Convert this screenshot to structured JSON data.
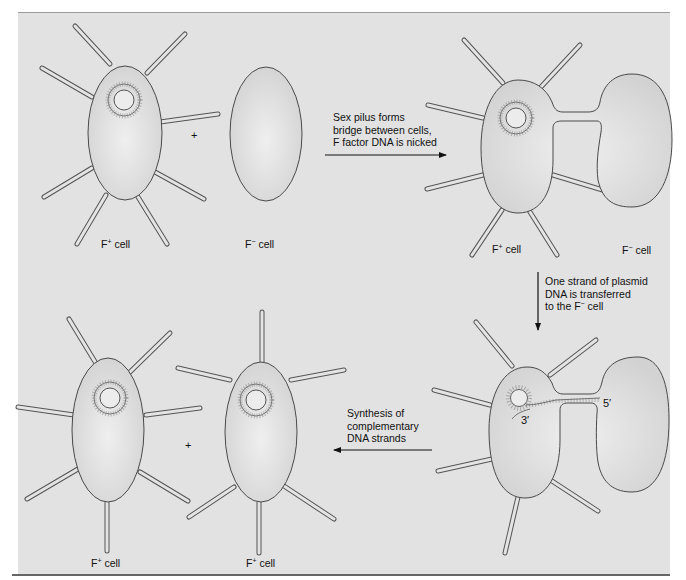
{
  "diagram": {
    "type": "bacterial-conjugation",
    "colors": {
      "panel_bg": "#e2e2e2",
      "cell_fill_center": "#ececec",
      "cell_fill_edge": "#d4d4d4",
      "outline": "#4a4a4a",
      "text": "#111111"
    },
    "panels": {
      "top_left": {
        "f_plus_label": {
          "base": "F",
          "sup": "+",
          "rest": " cell"
        },
        "f_minus_label": {
          "base": "F",
          "sup": "−",
          "rest": " cell"
        },
        "plus_sign": "+"
      },
      "top_right": {
        "f_plus_label": {
          "base": "F",
          "sup": "+",
          "rest": " cell"
        },
        "f_minus_label": {
          "base": "F",
          "sup": "−",
          "rest": " cell"
        }
      },
      "bottom_right": {
        "three_prime": "3′",
        "five_prime": "5′"
      },
      "bottom_left": {
        "left_label": {
          "base": "F",
          "sup": "+",
          "rest": " cell"
        },
        "right_label": {
          "base": "F",
          "sup": "+",
          "rest": " cell"
        },
        "plus_sign": "+"
      }
    },
    "steps": [
      {
        "direction": "right",
        "lines": [
          "Sex pilus forms",
          "bridge between cells,",
          "F factor DNA is nicked"
        ]
      },
      {
        "direction": "down",
        "lines": [
          "One strand of plasmid",
          "DNA is transferred"
        ],
        "last_line": {
          "prefix": "to the F",
          "sup": "−",
          "suffix": " cell"
        }
      },
      {
        "direction": "left",
        "lines": [
          "Synthesis of",
          "complementary",
          "DNA strands"
        ]
      }
    ]
  }
}
